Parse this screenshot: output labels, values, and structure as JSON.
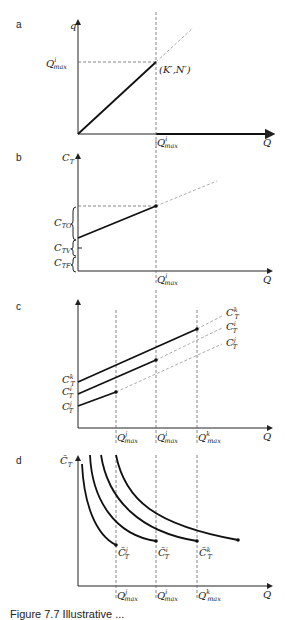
{
  "figure": {
    "caption_partial": "Figure 7.7 Illustrative ...",
    "panels": [
      {
        "id": "a",
        "label": "a"
      },
      {
        "id": "b",
        "label": "b"
      },
      {
        "id": "c",
        "label": "c"
      },
      {
        "id": "d",
        "label": "d"
      }
    ]
  },
  "panel_a": {
    "label": "a",
    "y_axis": "q",
    "x_axis": "Q",
    "y_mark": "Q",
    "y_mark_sup": "i",
    "y_mark_sub": "max",
    "x_mark": "Q",
    "x_mark_sup": "i",
    "x_mark_sub": "max",
    "point_label": "(K′,N′)"
  },
  "panel_b": {
    "label": "b",
    "y_axis": "C",
    "y_axis_sub": "T",
    "x_axis": "Q",
    "brace_labels": [
      {
        "main": "C",
        "sub": "TO"
      },
      {
        "main": "C",
        "sub": "TV"
      },
      {
        "main": "C",
        "sub": "TF"
      }
    ],
    "x_mark": "Q",
    "x_mark_sup": "i",
    "x_mark_sub": "max"
  },
  "panel_c": {
    "label": "c",
    "x_axis": "Q",
    "left_labels": [
      {
        "main": "C",
        "sub": "T",
        "sup": "k"
      },
      {
        "main": "C",
        "sub": "T",
        "sup": "i"
      },
      {
        "main": "C",
        "sub": "T",
        "sup": "j"
      }
    ],
    "right_labels": [
      {
        "main": "C",
        "sub": "T",
        "sup": "k"
      },
      {
        "main": "C",
        "sub": "T",
        "sup": "i"
      },
      {
        "main": "C",
        "sub": "T",
        "sup": "j"
      }
    ],
    "x_marks": [
      {
        "main": "Q",
        "sup": "j",
        "sub": "max"
      },
      {
        "main": "Q",
        "sup": "i",
        "sub": "max"
      },
      {
        "main": "Q",
        "sup": "k",
        "sub": "max"
      }
    ]
  },
  "panel_d": {
    "label": "d",
    "y_axis": "C̄",
    "y_axis_sub": "T",
    "x_axis": "Q",
    "point_labels": [
      {
        "main": "C̄",
        "sub": "T",
        "sup": "j"
      },
      {
        "main": "C̄",
        "sub": "T",
        "sup": "i"
      },
      {
        "main": "C̄",
        "sub": "T",
        "sup": "k"
      }
    ],
    "x_marks": [
      {
        "main": "Q",
        "sup": "j",
        "sub": "max"
      },
      {
        "main": "Q",
        "sup": "i",
        "sub": "max"
      },
      {
        "main": "Q",
        "sup": "k",
        "sub": "max"
      }
    ]
  }
}
